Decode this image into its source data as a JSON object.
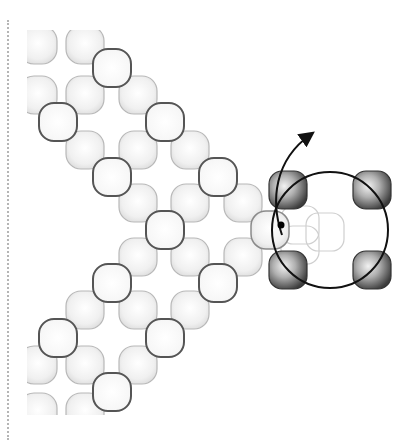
{
  "figure": {
    "type": "molecular-lattice-diagram",
    "colors": {
      "background": "#ffffff",
      "particle_fill_light": "#f4f4f4",
      "particle_edge_light": "#b8b8b8",
      "particle_edge_outlined": "#555555",
      "rotor_particle_dark": "#4a4a4a",
      "rotor_circle": "#111111",
      "arrow": "#111111",
      "border_dots": "#b5b5b5"
    },
    "particle_size": 38,
    "light_particles": [
      [
        38,
        45,
        "partial"
      ],
      [
        85,
        45,
        "plain"
      ],
      [
        38,
        95,
        "partial"
      ],
      [
        85,
        95,
        "plain"
      ],
      [
        138,
        95,
        "plain"
      ],
      [
        85,
        150,
        "plain"
      ],
      [
        138,
        150,
        "plain"
      ],
      [
        190,
        150,
        "plain"
      ],
      [
        138,
        203,
        "plain"
      ],
      [
        190,
        203,
        "plain"
      ],
      [
        243,
        203,
        "plain"
      ],
      [
        138,
        257,
        "plain"
      ],
      [
        190,
        257,
        "plain"
      ],
      [
        243,
        257,
        "plain"
      ],
      [
        85,
        310,
        "plain"
      ],
      [
        138,
        310,
        "plain"
      ],
      [
        190,
        310,
        "plain"
      ],
      [
        38,
        365,
        "partial"
      ],
      [
        85,
        365,
        "plain"
      ],
      [
        138,
        365,
        "plain"
      ],
      [
        38,
        412,
        "partial"
      ],
      [
        85,
        412,
        "partial"
      ]
    ],
    "outlined_particles": [
      [
        112,
        68
      ],
      [
        58,
        122
      ],
      [
        165,
        122
      ],
      [
        112,
        177
      ],
      [
        218,
        177
      ],
      [
        165,
        230
      ],
      [
        218,
        283
      ],
      [
        112,
        283
      ],
      [
        165,
        338
      ],
      [
        58,
        338
      ],
      [
        112,
        392
      ]
    ],
    "junction_particle": [
      270,
      230
    ],
    "ghost_particles": [
      [
        300,
        225
      ],
      [
        325,
        232
      ],
      [
        300,
        245
      ]
    ],
    "rotor": {
      "circle": {
        "cx": 330,
        "cy": 230,
        "r": 58
      },
      "dark_particles": [
        [
          288,
          190
        ],
        [
          372,
          190
        ],
        [
          288,
          270
        ],
        [
          372,
          270
        ]
      ],
      "pivot_dot": [
        281,
        225
      ],
      "arrow_path": "M282 235 C 270 200, 275 160, 310 135"
    }
  }
}
